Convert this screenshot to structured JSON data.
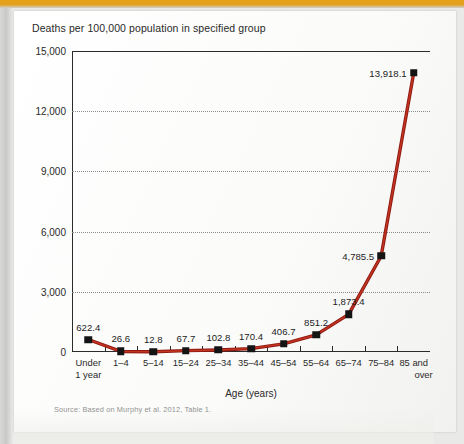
{
  "figure": {
    "y_axis_title": "Deaths per 100,000 population in specified group",
    "x_axis_title": "Age (years)",
    "source_note": "Source: Based on Murphy et al. 2012, Table 1."
  },
  "chart_data": {
    "type": "line",
    "title": "Deaths per 100,000 population in specified group",
    "xlabel": "Age (years)",
    "ylabel": "Deaths per 100,000 population in specified group",
    "categories": [
      "Under 1 year",
      "1–4",
      "5–14",
      "15–24",
      "25–34",
      "35–44",
      "45–54",
      "55–64",
      "65–74",
      "75–84",
      "85 and over"
    ],
    "category_lines": [
      [
        "Under",
        "1 year"
      ],
      [
        "1–4",
        ""
      ],
      [
        "5–14",
        ""
      ],
      [
        "15–24",
        ""
      ],
      [
        "25–34",
        ""
      ],
      [
        "35–44",
        ""
      ],
      [
        "45–54",
        ""
      ],
      [
        "55–64",
        ""
      ],
      [
        "65–74",
        ""
      ],
      [
        "75–84",
        ""
      ],
      [
        "85 and",
        "over"
      ]
    ],
    "values": [
      622.4,
      26.6,
      12.8,
      67.7,
      102.8,
      170.4,
      406.7,
      851.2,
      1873.4,
      4785.5,
      13918.1
    ],
    "point_labels": [
      "622.4",
      "26.6",
      "12.8",
      "67.7",
      "102.8",
      "170.4",
      "406.7",
      "851.2",
      "1,873.4",
      "4,785.5",
      "13,918.1"
    ],
    "ylim": [
      0,
      15000
    ],
    "yticks": [
      0,
      3000,
      6000,
      9000,
      12000,
      15000
    ],
    "ytick_labels": [
      "0",
      "3,000",
      "6,000",
      "9,000",
      "12,000",
      "15,000"
    ],
    "grid": true,
    "grid_style": "dotted",
    "legend": null,
    "series_color": "#8c1a12",
    "series_highlight_color": "#d83a22",
    "marker_color": "#141414",
    "marker_shape": "square"
  },
  "style": {
    "accent_bar_color": "#e2a01c",
    "axis_color": "#2b2b2b",
    "grid_color": "#8c8c8c",
    "text_color": "#2a2a2a",
    "source_text_color": "#8e8e8e",
    "sheet_color": "#fdfdfc"
  }
}
